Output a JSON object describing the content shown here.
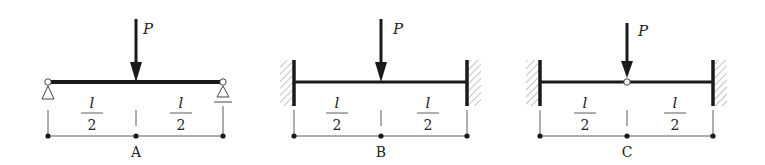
{
  "figure": {
    "colors": {
      "stroke": "#1a1a1a",
      "hatch": "#777777",
      "thin": "#333333",
      "background": "#ffffff"
    },
    "load_label": "P",
    "half_span_numerator": "l",
    "half_span_denominator": "2",
    "cases": [
      {
        "id": "A",
        "caption": "A",
        "left_support": "pin",
        "right_support": "roller",
        "midspan": "continuous",
        "segments": [
          {
            "numerator": "l",
            "denominator": "2"
          },
          {
            "numerator": "l",
            "denominator": "2"
          }
        ]
      },
      {
        "id": "B",
        "caption": "B",
        "left_support": "fixed",
        "right_support": "fixed",
        "midspan": "continuous",
        "segments": [
          {
            "numerator": "l",
            "denominator": "2"
          },
          {
            "numerator": "l",
            "denominator": "2"
          }
        ]
      },
      {
        "id": "C",
        "caption": "C",
        "left_support": "fixed",
        "right_support": "fixed",
        "midspan": "hinge",
        "segments": [
          {
            "numerator": "l",
            "denominator": "2"
          },
          {
            "numerator": "l",
            "denominator": "2"
          }
        ]
      }
    ]
  }
}
